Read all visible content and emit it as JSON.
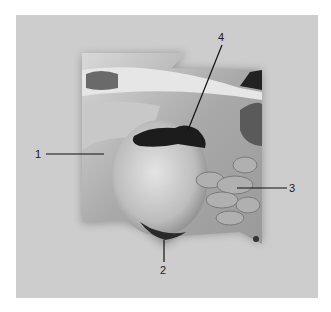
{
  "figure": {
    "background_color": "#ffffff",
    "panel_color": "#cdcdcd",
    "image_description": "Anatomical photograph of dissected specimen with numbered callouts",
    "labels": [
      {
        "id": "1",
        "text": "1",
        "x": 35,
        "y": 149
      },
      {
        "id": "2",
        "text": "2",
        "x": 160,
        "y": 265
      },
      {
        "id": "3",
        "text": "3",
        "x": 289,
        "y": 183
      },
      {
        "id": "4",
        "text": "4",
        "x": 218,
        "y": 32
      }
    ]
  }
}
